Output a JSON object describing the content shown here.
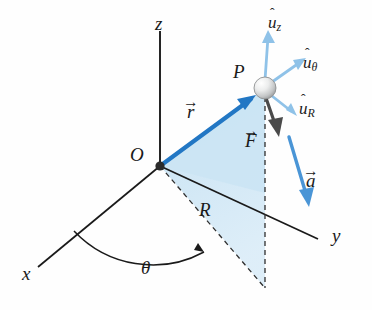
{
  "figure": {
    "type": "3d-cylindrical-coordinate-vector-diagram",
    "background_color": "#fefefe"
  },
  "colors": {
    "axis": "#1a1a1a",
    "r_vector": "#2277c4",
    "a_vector": "#4a95d6",
    "unit_vector": "#8fc2e8",
    "force_vector": "#4a4a4a",
    "shaded_plane": "#cfe6f5",
    "shaded_plane_edge": "#9ecbe6",
    "dashed_line": "#333333",
    "sphere_light": "#f2f2f2",
    "sphere_dark": "#a8a8a8",
    "origin_dot": "#2b2b2b"
  },
  "axes": [
    {
      "name": "z-axis",
      "label": "z",
      "x": 155,
      "y": 14
    },
    {
      "name": "x-axis",
      "label": "x",
      "x": 22,
      "y": 264
    },
    {
      "name": "y-axis",
      "label": "y",
      "x": 332,
      "y": 226
    }
  ],
  "points": [
    {
      "name": "origin",
      "label": "O",
      "x": 130,
      "y": 145
    },
    {
      "name": "point-p",
      "label": "P",
      "x": 233,
      "y": 62
    }
  ],
  "vectors": [
    {
      "name": "position-vector",
      "label": "r",
      "accent": "→",
      "x": 187,
      "y": 102,
      "color": "#2277c4"
    },
    {
      "name": "force-vector",
      "label": "F",
      "accent": "→",
      "x": 245,
      "y": 131,
      "color": "#4a4a4a"
    },
    {
      "name": "acceleration-vector",
      "label": "a",
      "accent": "→",
      "x": 306,
      "y": 171,
      "color": "#4a95d6"
    }
  ],
  "unit_vectors": [
    {
      "name": "unit-vector-z",
      "label": "u",
      "accent": "̂",
      "subscript": "z",
      "x": 268,
      "y": 14
    },
    {
      "name": "unit-vector-theta",
      "label": "u",
      "accent": "̂",
      "subscript": "θ",
      "x": 303,
      "y": 54
    },
    {
      "name": "unit-vector-r",
      "label": "u",
      "accent": "̂",
      "subscript": "R",
      "x": 299,
      "y": 100
    }
  ],
  "annotations": [
    {
      "name": "radial-distance-label",
      "label": "R",
      "x": 199,
      "y": 200
    },
    {
      "name": "azimuth-angle-label",
      "label": "θ",
      "x": 141,
      "y": 258
    }
  ],
  "geometry": {
    "origin": {
      "x": 160,
      "y": 166
    },
    "point_p": {
      "x": 265,
      "y": 88
    },
    "sphere_radius": 11,
    "z_axis_end": {
      "x": 160,
      "y": 30
    },
    "x_axis_end": {
      "x": 38,
      "y": 267
    },
    "y_axis_end": {
      "x": 318,
      "y": 239
    },
    "foot_point": {
      "x": 265,
      "y": 288
    },
    "plane_base": {
      "x": 265,
      "y": 193
    }
  }
}
